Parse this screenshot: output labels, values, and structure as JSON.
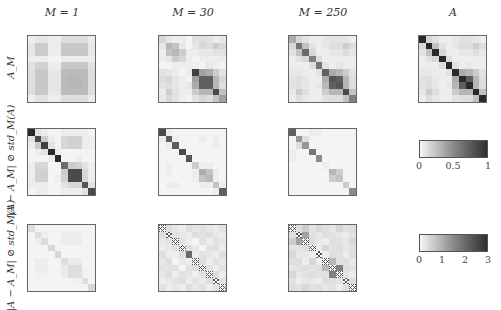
{
  "chart_data": {
    "type": "heatmap",
    "layout": {
      "rows": 3,
      "cols": 4,
      "matrix_size": 10
    },
    "column_titles": [
      "M = 1",
      "M = 30",
      "M = 250",
      "A"
    ],
    "row_labels": [
      "A_M",
      "|A − A_M| ⊘ std_M(A)",
      "|A − A_M| ⊘ std_M(A)"
    ],
    "colorbars": [
      {
        "applies_to_rows": [
          1,
          2
        ],
        "range": [
          0,
          1
        ],
        "ticks": [
          "0",
          "0.5",
          "1"
        ],
        "colormap": "gray-light-to-dark"
      },
      {
        "applies_to_rows": [
          3
        ],
        "range": [
          0,
          3
        ],
        "ticks": [
          "0",
          "1",
          "2",
          "3"
        ],
        "colormap": "gray-light-to-dark"
      }
    ],
    "hatch_note": "cross-hatched cells on diagonal of row 3 (M=30, M=250) indicate undefined values",
    "matrices": {
      "r1c1": [
        [
          0.05,
          0.08,
          0.08,
          0.05,
          0.05,
          0.12,
          0.12,
          0.12,
          0.12,
          0.05
        ],
        [
          0.08,
          0.2,
          0.2,
          0.05,
          0.05,
          0.22,
          0.22,
          0.22,
          0.22,
          0.08
        ],
        [
          0.08,
          0.2,
          0.2,
          0.05,
          0.05,
          0.22,
          0.22,
          0.22,
          0.22,
          0.08
        ],
        [
          0.05,
          0.05,
          0.05,
          0.02,
          0.02,
          0.05,
          0.05,
          0.05,
          0.05,
          0.05
        ],
        [
          0.1,
          0.18,
          0.18,
          0.05,
          0.05,
          0.22,
          0.22,
          0.22,
          0.22,
          0.1
        ],
        [
          0.12,
          0.22,
          0.22,
          0.08,
          0.08,
          0.28,
          0.28,
          0.28,
          0.28,
          0.12
        ],
        [
          0.12,
          0.22,
          0.22,
          0.08,
          0.08,
          0.28,
          0.3,
          0.3,
          0.28,
          0.12
        ],
        [
          0.12,
          0.22,
          0.22,
          0.08,
          0.08,
          0.28,
          0.3,
          0.3,
          0.28,
          0.12
        ],
        [
          0.12,
          0.22,
          0.22,
          0.08,
          0.08,
          0.28,
          0.28,
          0.28,
          0.28,
          0.12
        ],
        [
          0.05,
          0.1,
          0.1,
          0.05,
          0.05,
          0.12,
          0.12,
          0.12,
          0.12,
          0.05
        ]
      ],
      "r1c2": [
        [
          0.15,
          0.08,
          0.05,
          0.05,
          0.02,
          0.1,
          0.12,
          0.1,
          0.05,
          0.08
        ],
        [
          0.08,
          0.3,
          0.25,
          0.08,
          0.02,
          0.08,
          0.15,
          0.12,
          0.2,
          0.15
        ],
        [
          0.05,
          0.25,
          0.3,
          0.2,
          0.05,
          0.05,
          0.08,
          0.08,
          0.1,
          0.1
        ],
        [
          0.05,
          0.08,
          0.2,
          0.15,
          0.05,
          0.02,
          0.05,
          0.05,
          0.05,
          0.05
        ],
        [
          0.02,
          0.02,
          0.05,
          0.05,
          0.05,
          0.05,
          0.02,
          0.08,
          0.05,
          0.02
        ],
        [
          0.1,
          0.08,
          0.05,
          0.02,
          0.05,
          0.85,
          0.4,
          0.35,
          0.2,
          0.1
        ],
        [
          0.12,
          0.15,
          0.08,
          0.05,
          0.02,
          0.4,
          0.7,
          0.7,
          0.3,
          0.15
        ],
        [
          0.1,
          0.12,
          0.08,
          0.05,
          0.08,
          0.35,
          0.7,
          0.7,
          0.3,
          0.12
        ],
        [
          0.05,
          0.2,
          0.1,
          0.05,
          0.05,
          0.2,
          0.3,
          0.3,
          0.8,
          0.25
        ],
        [
          0.08,
          0.15,
          0.1,
          0.05,
          0.02,
          0.1,
          0.15,
          0.12,
          0.25,
          0.4
        ]
      ],
      "r1c3": [
        [
          0.35,
          0.15,
          0.1,
          0.05,
          0.05,
          0.08,
          0.1,
          0.1,
          0.08,
          0.05
        ],
        [
          0.15,
          0.6,
          0.25,
          0.1,
          0.05,
          0.08,
          0.12,
          0.12,
          0.2,
          0.12
        ],
        [
          0.1,
          0.25,
          0.65,
          0.15,
          0.05,
          0.05,
          0.08,
          0.08,
          0.12,
          0.08
        ],
        [
          0.05,
          0.1,
          0.15,
          0.55,
          0.12,
          0.05,
          0.05,
          0.05,
          0.05,
          0.05
        ],
        [
          0.05,
          0.05,
          0.05,
          0.12,
          0.6,
          0.1,
          0.05,
          0.08,
          0.05,
          0.05
        ],
        [
          0.08,
          0.08,
          0.05,
          0.05,
          0.1,
          0.7,
          0.35,
          0.3,
          0.2,
          0.1
        ],
        [
          0.1,
          0.12,
          0.08,
          0.05,
          0.05,
          0.35,
          0.75,
          0.7,
          0.3,
          0.12
        ],
        [
          0.1,
          0.12,
          0.08,
          0.05,
          0.08,
          0.3,
          0.7,
          0.75,
          0.3,
          0.12
        ],
        [
          0.08,
          0.2,
          0.12,
          0.05,
          0.05,
          0.2,
          0.3,
          0.3,
          0.8,
          0.25
        ],
        [
          0.05,
          0.12,
          0.08,
          0.05,
          0.05,
          0.1,
          0.12,
          0.12,
          0.25,
          0.55
        ]
      ],
      "r1c4": [
        [
          0.95,
          0.15,
          0.1,
          0.05,
          0.05,
          0.08,
          0.1,
          0.1,
          0.08,
          0.05
        ],
        [
          0.15,
          0.95,
          0.25,
          0.1,
          0.05,
          0.08,
          0.12,
          0.12,
          0.2,
          0.12
        ],
        [
          0.1,
          0.25,
          0.95,
          0.15,
          0.05,
          0.05,
          0.08,
          0.08,
          0.12,
          0.08
        ],
        [
          0.05,
          0.1,
          0.15,
          0.95,
          0.12,
          0.05,
          0.05,
          0.05,
          0.05,
          0.05
        ],
        [
          0.05,
          0.05,
          0.05,
          0.12,
          0.95,
          0.1,
          0.05,
          0.08,
          0.05,
          0.05
        ],
        [
          0.08,
          0.08,
          0.05,
          0.05,
          0.1,
          0.95,
          0.35,
          0.3,
          0.2,
          0.1
        ],
        [
          0.1,
          0.12,
          0.08,
          0.05,
          0.05,
          0.35,
          0.95,
          0.7,
          0.3,
          0.12
        ],
        [
          0.1,
          0.12,
          0.08,
          0.05,
          0.08,
          0.3,
          0.7,
          0.95,
          0.3,
          0.12
        ],
        [
          0.08,
          0.2,
          0.12,
          0.05,
          0.05,
          0.2,
          0.3,
          0.3,
          0.95,
          0.25
        ],
        [
          0.05,
          0.12,
          0.08,
          0.05,
          0.05,
          0.1,
          0.12,
          0.12,
          0.25,
          0.95
        ]
      ],
      "r2c1": [
        [
          0.95,
          0.1,
          0.05,
          0.02,
          0.02,
          0.05,
          0.05,
          0.05,
          0.05,
          0.02
        ],
        [
          0.1,
          0.8,
          0.2,
          0.05,
          0.02,
          0.15,
          0.18,
          0.18,
          0.05,
          0.05
        ],
        [
          0.05,
          0.2,
          0.85,
          0.1,
          0.02,
          0.15,
          0.18,
          0.18,
          0.05,
          0.05
        ],
        [
          0.02,
          0.05,
          0.1,
          0.95,
          0.05,
          0.02,
          0.02,
          0.02,
          0.02,
          0.02
        ],
        [
          0.02,
          0.02,
          0.02,
          0.05,
          0.95,
          0.02,
          0.02,
          0.05,
          0.02,
          0.02
        ],
        [
          0.05,
          0.15,
          0.15,
          0.02,
          0.02,
          0.65,
          0.2,
          0.18,
          0.1,
          0.05
        ],
        [
          0.05,
          0.18,
          0.18,
          0.02,
          0.02,
          0.2,
          0.8,
          0.8,
          0.15,
          0.05
        ],
        [
          0.05,
          0.18,
          0.18,
          0.02,
          0.05,
          0.18,
          0.8,
          0.8,
          0.15,
          0.05
        ],
        [
          0.05,
          0.05,
          0.05,
          0.02,
          0.02,
          0.1,
          0.15,
          0.15,
          0.75,
          0.1
        ],
        [
          0.02,
          0.05,
          0.05,
          0.02,
          0.02,
          0.05,
          0.05,
          0.05,
          0.1,
          0.8
        ]
      ],
      "r2c2": [
        [
          0.8,
          0.05,
          0.02,
          0.02,
          0.02,
          0.02,
          0.02,
          0.02,
          0.02,
          0.02
        ],
        [
          0.05,
          0.7,
          0.05,
          0.02,
          0.02,
          0.02,
          0.05,
          0.02,
          0.05,
          0.02
        ],
        [
          0.02,
          0.05,
          0.72,
          0.02,
          0.02,
          0.02,
          0.02,
          0.02,
          0.05,
          0.02
        ],
        [
          0.02,
          0.02,
          0.02,
          0.8,
          0.02,
          0.02,
          0.02,
          0.02,
          0.02,
          0.02
        ],
        [
          0.02,
          0.02,
          0.02,
          0.02,
          0.75,
          0.02,
          0.02,
          0.02,
          0.02,
          0.02
        ],
        [
          0.02,
          0.05,
          0.02,
          0.02,
          0.02,
          0.2,
          0.05,
          0.05,
          0.02,
          0.02
        ],
        [
          0.02,
          0.05,
          0.02,
          0.02,
          0.02,
          0.05,
          0.35,
          0.25,
          0.05,
          0.02
        ],
        [
          0.02,
          0.02,
          0.02,
          0.02,
          0.02,
          0.05,
          0.25,
          0.3,
          0.05,
          0.02
        ],
        [
          0.02,
          0.05,
          0.05,
          0.02,
          0.02,
          0.02,
          0.05,
          0.05,
          0.25,
          0.05
        ],
        [
          0.02,
          0.02,
          0.02,
          0.02,
          0.02,
          0.02,
          0.02,
          0.02,
          0.05,
          0.7
        ]
      ],
      "r2c3": [
        [
          0.7,
          0.02,
          0.02,
          0.05,
          0.05,
          0.02,
          0.02,
          0.02,
          0.02,
          0.02
        ],
        [
          0.02,
          0.45,
          0.12,
          0.02,
          0.02,
          0.02,
          0.02,
          0.02,
          0.02,
          0.02
        ],
        [
          0.02,
          0.12,
          0.45,
          0.02,
          0.02,
          0.02,
          0.02,
          0.02,
          0.02,
          0.02
        ],
        [
          0.05,
          0.02,
          0.02,
          0.6,
          0.02,
          0.02,
          0.02,
          0.02,
          0.02,
          0.02
        ],
        [
          0.05,
          0.02,
          0.02,
          0.02,
          0.5,
          0.02,
          0.02,
          0.02,
          0.02,
          0.02
        ],
        [
          0.02,
          0.02,
          0.02,
          0.02,
          0.02,
          0.05,
          0.02,
          0.02,
          0.02,
          0.02
        ],
        [
          0.02,
          0.02,
          0.02,
          0.02,
          0.02,
          0.02,
          0.3,
          0.2,
          0.02,
          0.02
        ],
        [
          0.02,
          0.02,
          0.02,
          0.02,
          0.02,
          0.02,
          0.2,
          0.25,
          0.02,
          0.02
        ],
        [
          0.02,
          0.02,
          0.02,
          0.02,
          0.02,
          0.02,
          0.02,
          0.02,
          0.2,
          0.02
        ],
        [
          0.02,
          0.02,
          0.02,
          0.02,
          0.02,
          0.02,
          0.02,
          0.02,
          0.02,
          0.5
        ]
      ],
      "r3c1": [
        [
          0.12,
          0.02,
          0.02,
          0.02,
          0.02,
          0.02,
          0.02,
          0.02,
          0.02,
          0.02
        ],
        [
          0.02,
          0.12,
          0.05,
          0.02,
          0.02,
          0.05,
          0.05,
          0.05,
          0.02,
          0.02
        ],
        [
          0.02,
          0.05,
          0.13,
          0.02,
          0.02,
          0.05,
          0.05,
          0.05,
          0.02,
          0.02
        ],
        [
          0.02,
          0.02,
          0.02,
          0.15,
          0.02,
          0.02,
          0.02,
          0.02,
          0.02,
          0.02
        ],
        [
          0.02,
          0.02,
          0.02,
          0.02,
          0.15,
          0.02,
          0.02,
          0.02,
          0.02,
          0.02
        ],
        [
          0.02,
          0.05,
          0.05,
          0.02,
          0.02,
          0.12,
          0.06,
          0.06,
          0.02,
          0.02
        ],
        [
          0.02,
          0.05,
          0.05,
          0.02,
          0.02,
          0.06,
          0.12,
          0.12,
          0.03,
          0.02
        ],
        [
          0.02,
          0.03,
          0.03,
          0.02,
          0.02,
          0.06,
          0.12,
          0.12,
          0.03,
          0.02
        ],
        [
          0.02,
          0.02,
          0.02,
          0.02,
          0.02,
          0.02,
          0.03,
          0.03,
          0.12,
          0.02
        ],
        [
          0.02,
          0.02,
          0.02,
          0.02,
          0.02,
          0.02,
          0.02,
          0.02,
          0.02,
          0.15
        ]
      ],
      "r3c2": [
        [
          "h",
          0.12,
          0.08,
          0.05,
          0.12,
          0.08,
          0.1,
          0.08,
          0.05,
          0.1
        ],
        [
          0.12,
          "h",
          0.1,
          0.08,
          0.05,
          0.12,
          0.1,
          0.12,
          0.08,
          0.05
        ],
        [
          0.08,
          0.1,
          "h",
          0.1,
          0.05,
          0.02,
          0.1,
          0.05,
          0.1,
          0.08
        ],
        [
          0.05,
          0.08,
          0.1,
          "h",
          0.12,
          0.08,
          0.02,
          0.1,
          0.12,
          0.05
        ],
        [
          0.12,
          0.05,
          0.05,
          0.12,
          0.65,
          0.05,
          0.1,
          0.08,
          0.05,
          0.12
        ],
        [
          0.08,
          0.12,
          0.02,
          0.08,
          0.05,
          "h",
          0.12,
          0.05,
          0.1,
          0.08
        ],
        [
          0.1,
          0.1,
          0.1,
          0.02,
          0.1,
          0.12,
          "h",
          0.1,
          0.05,
          0.1
        ],
        [
          0.08,
          0.12,
          0.05,
          0.1,
          0.08,
          0.05,
          0.1,
          "h",
          0.12,
          0.05
        ],
        [
          0.05,
          0.08,
          0.1,
          0.12,
          0.05,
          0.1,
          0.05,
          0.12,
          "h",
          0.1
        ],
        [
          0.1,
          0.05,
          0.08,
          0.05,
          0.12,
          0.08,
          0.1,
          0.05,
          0.1,
          "h"
        ]
      ],
      "r3c3": [
        [
          "h",
          0.12,
          0.2,
          0.1,
          0.15,
          0.12,
          0.08,
          0.15,
          0.1,
          0.12
        ],
        [
          0.12,
          "h",
          0.4,
          0.1,
          0.08,
          0.12,
          0.1,
          0.08,
          0.05,
          0.1
        ],
        [
          0.2,
          0.4,
          "h",
          0.12,
          0.08,
          0.05,
          0.12,
          0.1,
          0.08,
          0.15
        ],
        [
          0.1,
          0.1,
          0.12,
          "h",
          0.05,
          0.15,
          0.1,
          0.12,
          0.08,
          0.1
        ],
        [
          0.15,
          0.08,
          0.08,
          0.05,
          "h",
          0.05,
          0.12,
          0.1,
          0.05,
          0.12
        ],
        [
          0.12,
          0.12,
          0.05,
          0.15,
          0.05,
          "h",
          0.3,
          0.1,
          0.12,
          0.08
        ],
        [
          0.08,
          0.1,
          0.12,
          0.1,
          0.12,
          0.3,
          "h",
          0.55,
          0.12,
          0.1
        ],
        [
          0.15,
          0.08,
          0.1,
          0.12,
          0.1,
          0.1,
          0.55,
          "h",
          0.1,
          0.05
        ],
        [
          0.1,
          0.05,
          0.08,
          0.08,
          0.05,
          0.12,
          0.12,
          0.1,
          "h",
          0.12
        ],
        [
          0.12,
          0.1,
          0.15,
          0.1,
          0.12,
          0.08,
          0.1,
          0.05,
          0.12,
          "h"
        ]
      ]
    }
  },
  "labels": {
    "col1": "M = 1",
    "col2": "M = 30",
    "col3": "M = 250",
    "col4": "A",
    "row1": "A_M",
    "row2": "|A − A_M| ⊘ std_M(A)",
    "row3": "|A − A_M| ⊘ std_M(A)"
  },
  "colorbar1_ticks": [
    "0",
    "0.5",
    "1"
  ],
  "colorbar2_ticks": [
    "0",
    "1",
    "2",
    "3"
  ]
}
